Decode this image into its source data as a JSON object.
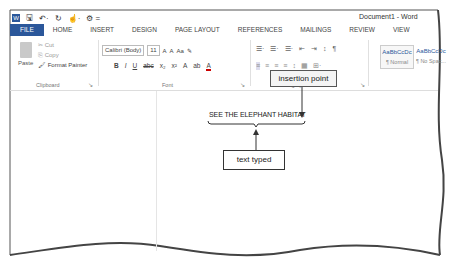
{
  "window": {
    "title": "Document1 - Word"
  },
  "quick_access": [
    {
      "icon": "word-app-icon"
    },
    {
      "icon": "save-icon",
      "glyph": "🖫"
    },
    {
      "icon": "undo-icon",
      "glyph": "↶·"
    },
    {
      "icon": "redo-icon",
      "glyph": "↻"
    },
    {
      "icon": "touch-mode-icon",
      "glyph": "☝·"
    },
    {
      "icon": "customize-icon",
      "glyph": "⚙ ="
    }
  ],
  "tabs": [
    {
      "label": "FILE"
    },
    {
      "label": "HOME"
    },
    {
      "label": "INSERT"
    },
    {
      "label": "DESIGN"
    },
    {
      "label": "PAGE LAYOUT"
    },
    {
      "label": "REFERENCES"
    },
    {
      "label": "MAILINGS"
    },
    {
      "label": "REVIEW"
    },
    {
      "label": "VIEW"
    }
  ],
  "ribbon": {
    "clipboard": {
      "paste": "Paste",
      "cut": "✂ Cut",
      "copy": "⎘ Copy",
      "format_painter": "🖌 Format Painter",
      "label": "Clipboard",
      "launcher": "↘"
    },
    "font": {
      "font_name": "Calibri (Body)",
      "font_size": "11",
      "grow": "A",
      "shrink": "A",
      "change_case": "Aa",
      "clear_format": "✎",
      "bold": "B",
      "italic": "I",
      "underline": "U",
      "strike": "abc",
      "subscript": "x₂",
      "superscript": "x²",
      "text_effects": "A",
      "highlight": "ab",
      "font_color": "A",
      "label": "Font",
      "launcher": "↘"
    },
    "paragraph": {
      "row1": [
        "☰·",
        "☰·",
        "☰·",
        "⇤",
        "⇥",
        "↕",
        "¶"
      ],
      "row2": [
        "≡",
        "≡",
        "≡",
        "≡",
        "↕",
        "▦",
        "⊞·"
      ],
      "label": "Paragraph",
      "launcher": "↘"
    },
    "styles": [
      {
        "preview": "AaBbCcDc",
        "name": "¶ Normal"
      },
      {
        "preview": "AaBbCcDc",
        "name": "¶ No Spac..."
      }
    ]
  },
  "document": {
    "typed_text": "SEE THE ELEPHANT HABITAT"
  },
  "callouts": {
    "insertion_point": "insertion point",
    "text_typed": "text typed"
  }
}
